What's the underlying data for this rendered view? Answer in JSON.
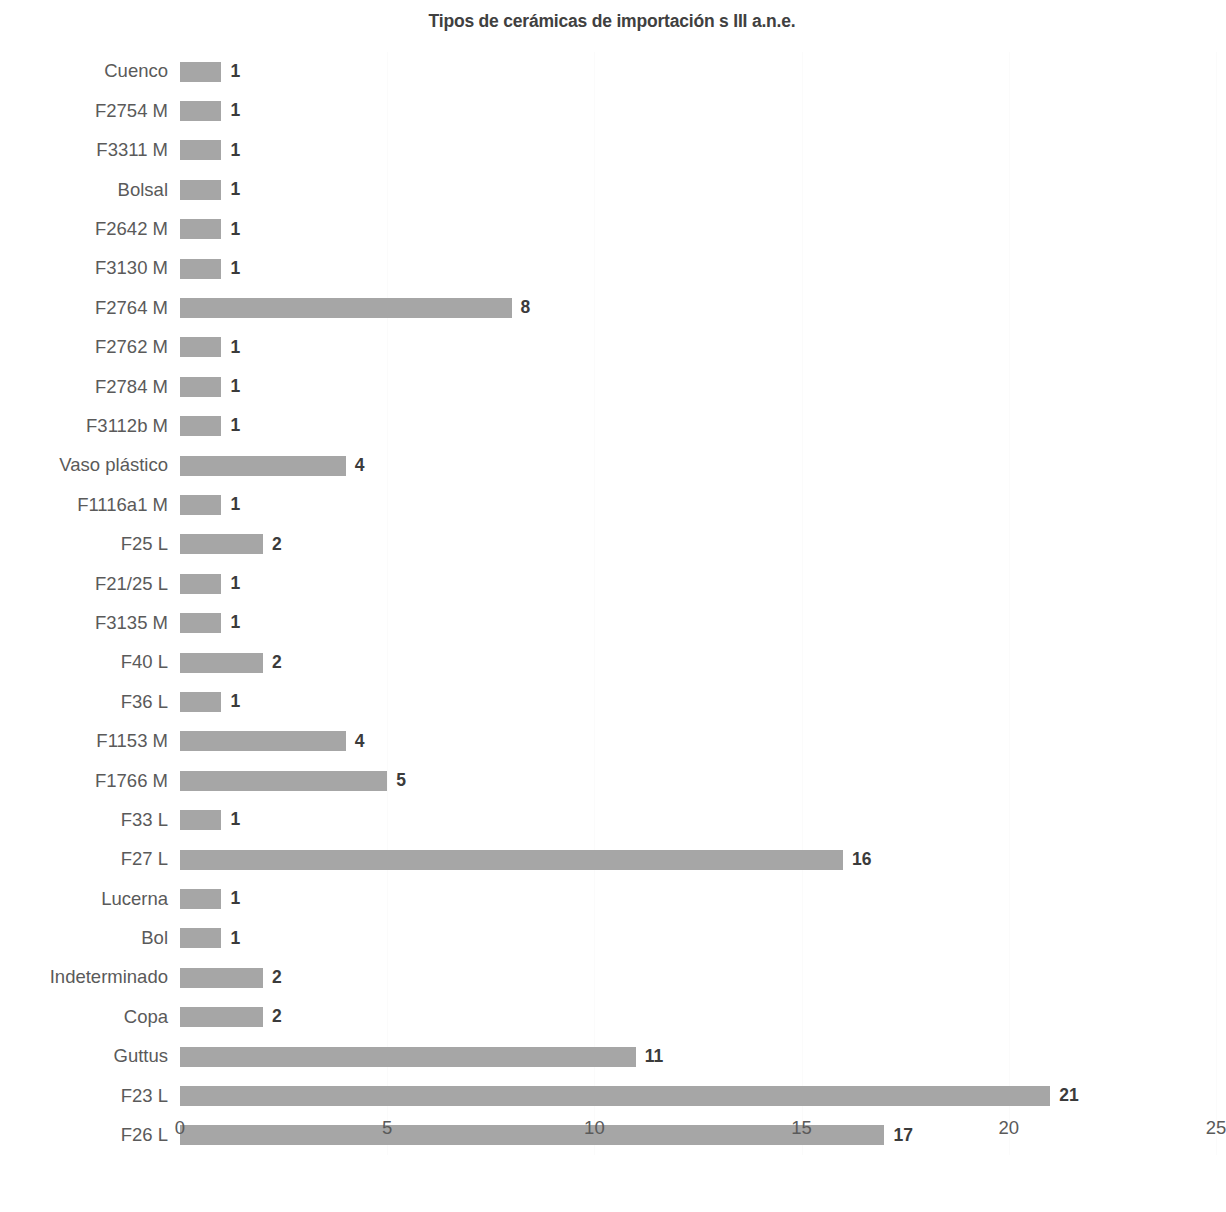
{
  "chart_data": {
    "type": "bar",
    "orientation": "horizontal",
    "title": "Tipos de cerámicas de importación s III a.n.e.",
    "xlabel": "",
    "ylabel": "",
    "xlim": [
      0,
      25
    ],
    "xticks": [
      "0",
      "5",
      "10",
      "15",
      "20",
      "25"
    ],
    "xtick_values": [
      0,
      5,
      10,
      15,
      20,
      25
    ],
    "grid": true,
    "legend": false,
    "bar_color": "#a6a6a6",
    "label_color": "#5a5a5a",
    "value_color": "#3b3b3b",
    "title_color": "#404040",
    "categories": [
      "Cuenco",
      "F2754 M",
      "F3311 M",
      "Bolsal",
      "F2642 M",
      "F3130 M",
      "F2764 M",
      "F2762 M",
      "F2784 M",
      "F3112b M",
      "Vaso plástico",
      "F1116a1 M",
      "F25 L",
      "F21/25 L",
      "F3135 M",
      "F40 L",
      "F36 L",
      "F1153 M",
      "F1766 M",
      "F33 L",
      "F27 L",
      "Lucerna",
      "Bol",
      "Indeterminado",
      "Copa",
      "Guttus",
      "F23 L",
      "F26 L"
    ],
    "values": [
      1,
      1,
      1,
      1,
      1,
      1,
      8,
      1,
      1,
      1,
      4,
      1,
      2,
      1,
      1,
      2,
      1,
      4,
      5,
      1,
      16,
      1,
      1,
      2,
      2,
      11,
      21,
      17
    ],
    "data_labels": [
      "1",
      "1",
      "1",
      "1",
      "1",
      "1",
      "8",
      "1",
      "1",
      "1",
      "4",
      "1",
      "2",
      "1",
      "1",
      "2",
      "1",
      "4",
      "5",
      "1",
      "16",
      "1",
      "1",
      "2",
      "2",
      "11",
      "21",
      "17"
    ]
  }
}
